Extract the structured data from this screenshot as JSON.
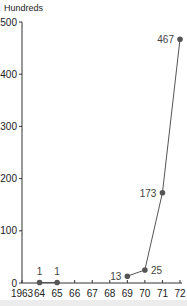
{
  "chart_data": {
    "type": "line",
    "title": "",
    "xlabel": "",
    "ylabel": "Hundreds",
    "x_ticks": [
      "1963",
      "64",
      "65",
      "66",
      "67",
      "68",
      "69",
      "70",
      "71",
      "72"
    ],
    "y_ticks": [
      "0",
      "100",
      "200",
      "300",
      "400",
      "500"
    ],
    "ylim": [
      0,
      500
    ],
    "xlim": [
      1963,
      1972
    ],
    "grid": false,
    "legend": null,
    "series": [
      {
        "name": "Hundreds",
        "segments": [
          {
            "x": [
              1964,
              1965
            ],
            "y": [
              1,
              1
            ]
          },
          {
            "x": [
              1969,
              1970,
              1971,
              1972
            ],
            "y": [
              13,
              25,
              173,
              467
            ]
          }
        ],
        "points": [
          {
            "x": 1964,
            "y": 1,
            "label": "1"
          },
          {
            "x": 1965,
            "y": 1,
            "label": "1"
          },
          {
            "x": 1969,
            "y": 13,
            "label": "13"
          },
          {
            "x": 1970,
            "y": 25,
            "label": "25"
          },
          {
            "x": 1971,
            "y": 173,
            "label": "173"
          },
          {
            "x": 1972,
            "y": 467,
            "label": "467"
          }
        ]
      }
    ]
  },
  "colors": {
    "line": "#555555",
    "marker": "#555555",
    "axis": "#333333",
    "text": "#222222"
  }
}
